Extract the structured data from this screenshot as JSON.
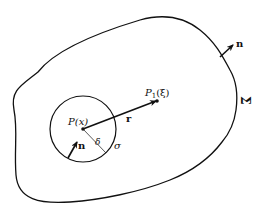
{
  "diagram": {
    "region_label": "Σ",
    "outer_normal_label": "n",
    "inner_normal_label": "n",
    "point_p_label": "P(x)",
    "point_p1_label": "P",
    "point_p1_sub": "1",
    "point_p1_arg": "(ξ)",
    "vector_label": "r",
    "radius_label": "δ",
    "sphere_label": "σ"
  }
}
